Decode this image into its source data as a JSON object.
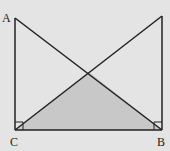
{
  "diagram": {
    "labels": {
      "A": "A",
      "B": "B",
      "C": "C"
    },
    "points": {
      "A": [
        15,
        18
      ],
      "C": [
        15,
        130
      ],
      "B": [
        162,
        130
      ],
      "D": [
        162,
        16
      ],
      "O": [
        89,
        72
      ]
    },
    "colors": {
      "background": "#e4e4e4",
      "stroke": "#222222",
      "shade": "#c8c8c8"
    }
  }
}
